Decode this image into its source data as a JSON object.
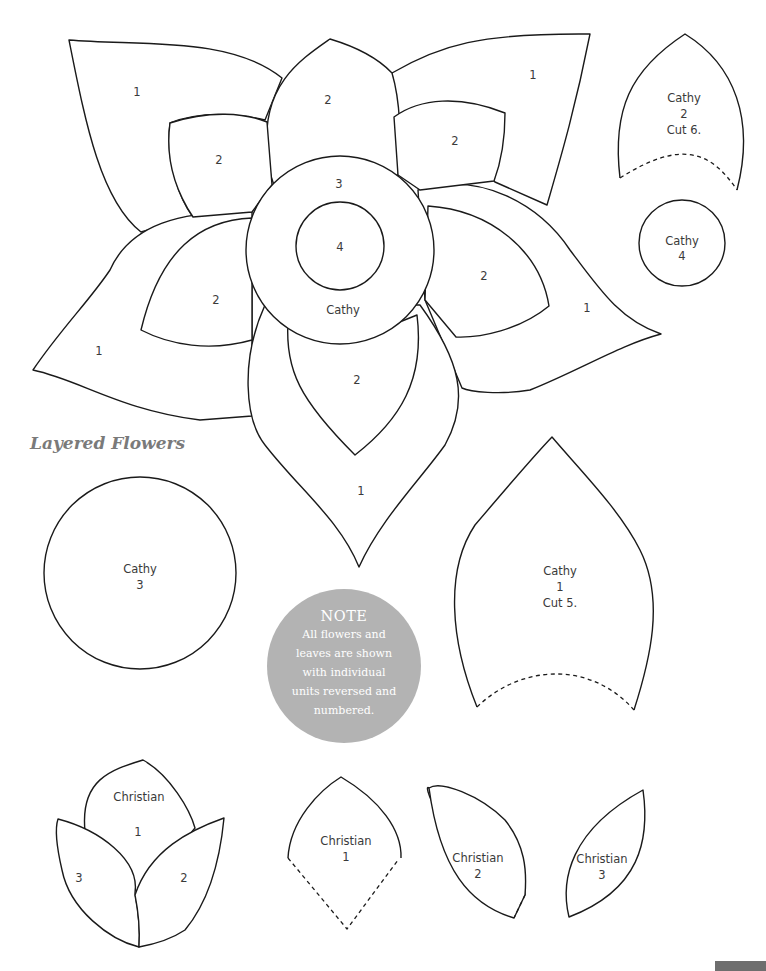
{
  "page": {
    "title": "Layered Flowers",
    "note": {
      "heading": "NOTE",
      "lines": [
        "All flowers and",
        "leaves are shown",
        "with individual",
        "units reversed and",
        "numbered."
      ]
    },
    "accent_colors": {
      "title": "#7a7a7a",
      "note_bg": "#b3b3b3",
      "outline": "#1a1a1a",
      "page_tab": "#6e6e6e"
    }
  },
  "large_flower": {
    "name": "Cathy",
    "outer_petal_labels": [
      "1",
      "1",
      "1",
      "1",
      "1"
    ],
    "inner_petal_labels": [
      "2",
      "2",
      "2",
      "2",
      "2",
      "2"
    ],
    "ring_label": "3",
    "center_label": "4",
    "name_label": "Cathy"
  },
  "templates": {
    "cathy_2": {
      "name": "Cathy",
      "number": "2",
      "cut": "Cut 6."
    },
    "cathy_4": {
      "name": "Cathy",
      "number": "4"
    },
    "cathy_3": {
      "name": "Cathy",
      "number": "3"
    },
    "cathy_1": {
      "name": "Cathy",
      "number": "1",
      "cut": "Cut 5."
    },
    "christian_flower": {
      "name": "Christian",
      "labels": [
        "1",
        "2",
        "3"
      ]
    },
    "christian_1": {
      "name": "Christian",
      "number": "1"
    },
    "christian_2": {
      "name": "Christian",
      "number": "2"
    },
    "christian_3": {
      "name": "Christian",
      "number": "3"
    }
  }
}
